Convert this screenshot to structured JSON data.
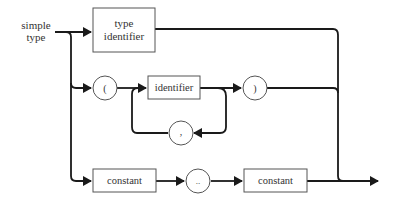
{
  "diagram": {
    "start_label_line1": "simple",
    "start_label_line2": "type",
    "nodes": {
      "type_identifier_line1": "type",
      "type_identifier_line2": "identifier",
      "open_paren": "(",
      "identifier": "identifier",
      "close_paren": ")",
      "comma": ",",
      "constant_1": "constant",
      "range_dots": "..",
      "constant_2": "constant"
    },
    "colors": {
      "line": "#1a1a1a",
      "box_stroke": "#555555",
      "text": "#333333"
    }
  }
}
